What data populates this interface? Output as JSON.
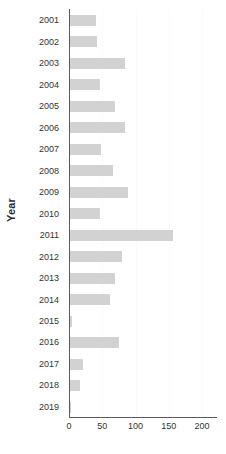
{
  "chart_data": {
    "type": "bar",
    "orientation": "horizontal",
    "title": "",
    "xlabel": "",
    "ylabel": "Year",
    "xlim": [
      0,
      200
    ],
    "ylim": null,
    "grid": true,
    "legend": null,
    "bar_color": "#d2d2d2",
    "axis_color": "#5a5a5a",
    "text_color": "#333333",
    "xticks": [
      0,
      50,
      100,
      150,
      200
    ],
    "xticklabels": [
      "0",
      "50",
      "100",
      "150",
      "200"
    ],
    "categories": [
      "2001",
      "2002",
      "2003",
      "2004",
      "2005",
      "2006",
      "2007",
      "2008",
      "2009",
      "2010",
      "2011",
      "2012",
      "2013",
      "2014",
      "2015",
      "2016",
      "2017",
      "2018",
      "2019"
    ],
    "values": [
      41,
      42,
      84,
      46,
      69,
      84,
      48,
      66,
      89,
      47,
      156,
      80,
      69,
      62,
      4,
      75,
      21,
      16,
      3
    ]
  }
}
